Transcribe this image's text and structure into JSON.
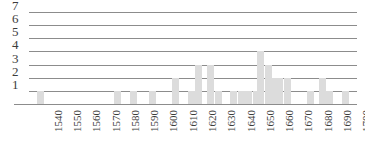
{
  "chart_data": {
    "type": "bar",
    "title": "",
    "subtitle": "",
    "xlabel": "",
    "ylabel": "",
    "grid": true,
    "legend": null,
    "legend_position": "none",
    "xlim": [
      1535,
      1705
    ],
    "ylim": [
      0,
      7
    ],
    "ytick_labels": [
      "1",
      "2",
      "3",
      "4",
      "5",
      "6",
      "7"
    ],
    "ytick_values": [
      1,
      2,
      3,
      4,
      5,
      6,
      7
    ],
    "xtick_labels": [
      "1540",
      "1550",
      "1560",
      "1570",
      "1580",
      "1590",
      "1600",
      "1610",
      "1620",
      "1630",
      "1640",
      "1650",
      "1660",
      "1670",
      "1680",
      "1690",
      "1700"
    ],
    "xtick_values": [
      1540,
      1550,
      1560,
      1570,
      1580,
      1590,
      1600,
      1610,
      1620,
      1630,
      1640,
      1650,
      1660,
      1670,
      1680,
      1690,
      1700
    ],
    "bar_color": "#dcdcdc",
    "axis_color": "#8c8c8c",
    "x": [
      1541,
      1581,
      1589,
      1599,
      1611,
      1619,
      1623,
      1629,
      1633,
      1641,
      1645,
      1649,
      1653,
      1655,
      1659,
      1661,
      1665,
      1669,
      1681,
      1687,
      1691,
      1699
    ],
    "values": [
      1,
      1,
      1,
      1,
      2,
      1,
      3,
      3,
      1,
      1,
      1,
      1,
      1,
      4,
      3,
      2,
      2,
      2,
      1,
      2,
      1,
      1
    ],
    "bars": [
      {
        "x": 1541,
        "value": 1
      },
      {
        "x": 1581,
        "value": 1
      },
      {
        "x": 1589,
        "value": 1
      },
      {
        "x": 1599,
        "value": 1
      },
      {
        "x": 1611,
        "value": 2
      },
      {
        "x": 1619,
        "value": 1
      },
      {
        "x": 1623,
        "value": 3
      },
      {
        "x": 1629,
        "value": 3
      },
      {
        "x": 1633,
        "value": 1
      },
      {
        "x": 1641,
        "value": 1
      },
      {
        "x": 1645,
        "value": 1
      },
      {
        "x": 1649,
        "value": 1
      },
      {
        "x": 1653,
        "value": 1
      },
      {
        "x": 1655,
        "value": 4
      },
      {
        "x": 1659,
        "value": 3
      },
      {
        "x": 1661,
        "value": 2
      },
      {
        "x": 1665,
        "value": 2
      },
      {
        "x": 1669,
        "value": 2
      },
      {
        "x": 1681,
        "value": 1
      },
      {
        "x": 1687,
        "value": 2
      },
      {
        "x": 1691,
        "value": 1
      },
      {
        "x": 1699,
        "value": 1
      }
    ]
  }
}
